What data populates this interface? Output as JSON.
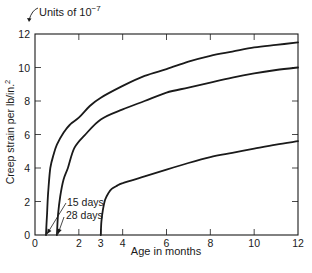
{
  "chart_data": {
    "type": "line",
    "title": "",
    "units_note": "Units of 10",
    "units_exponent": "−7",
    "xlabel": "Age in months",
    "ylabel": "Creep strain per lb/in.",
    "ylabel_sup": "2",
    "xlim": [
      0,
      12
    ],
    "ylim": [
      0,
      12
    ],
    "x_ticks": [
      0,
      2,
      3,
      4,
      6,
      8,
      10,
      12
    ],
    "y_ticks": [
      0,
      2,
      4,
      6,
      8,
      10,
      12
    ],
    "grid": false,
    "series": [
      {
        "name": "15 days",
        "x": [
          0.5,
          0.55,
          0.6,
          0.7,
          0.85,
          1.0,
          1.3,
          1.6,
          2.0,
          2.5,
          3.0,
          4.0,
          5.0,
          6.0,
          7.0,
          8.0,
          9.0,
          10.0,
          11.0,
          12.0
        ],
        "y": [
          0,
          1.3,
          2.5,
          4.0,
          4.8,
          5.4,
          6.1,
          6.6,
          7.0,
          7.7,
          8.2,
          8.9,
          9.5,
          9.9,
          10.35,
          10.7,
          10.95,
          11.2,
          11.35,
          11.5
        ]
      },
      {
        "name": "28 days",
        "x": [
          1.0,
          1.05,
          1.15,
          1.3,
          1.5,
          1.8,
          2.3,
          3.0,
          4.0,
          5.0,
          6.0,
          7.0,
          8.0,
          9.0,
          10.0,
          11.0,
          12.0
        ],
        "y": [
          0,
          1.2,
          2.3,
          3.3,
          4.0,
          5.2,
          6.0,
          6.9,
          7.5,
          8.0,
          8.5,
          8.8,
          9.1,
          9.4,
          9.65,
          9.85,
          10.0
        ]
      },
      {
        "name": "3 months",
        "x": [
          3.0,
          3.03,
          3.1,
          3.2,
          3.35,
          3.5,
          3.75,
          4.0,
          5.0,
          6.0,
          7.0,
          8.0,
          9.0,
          10.0,
          11.0,
          12.0
        ],
        "y": [
          0,
          0.8,
          1.5,
          2.1,
          2.5,
          2.75,
          2.95,
          3.1,
          3.5,
          3.9,
          4.3,
          4.65,
          4.9,
          5.15,
          5.4,
          5.6
        ]
      }
    ],
    "annotations": [
      {
        "text": "15 days",
        "points_to_x": 0.5
      },
      {
        "text": "28 days",
        "points_to_x": 1.0
      }
    ],
    "legend_position": "none"
  }
}
